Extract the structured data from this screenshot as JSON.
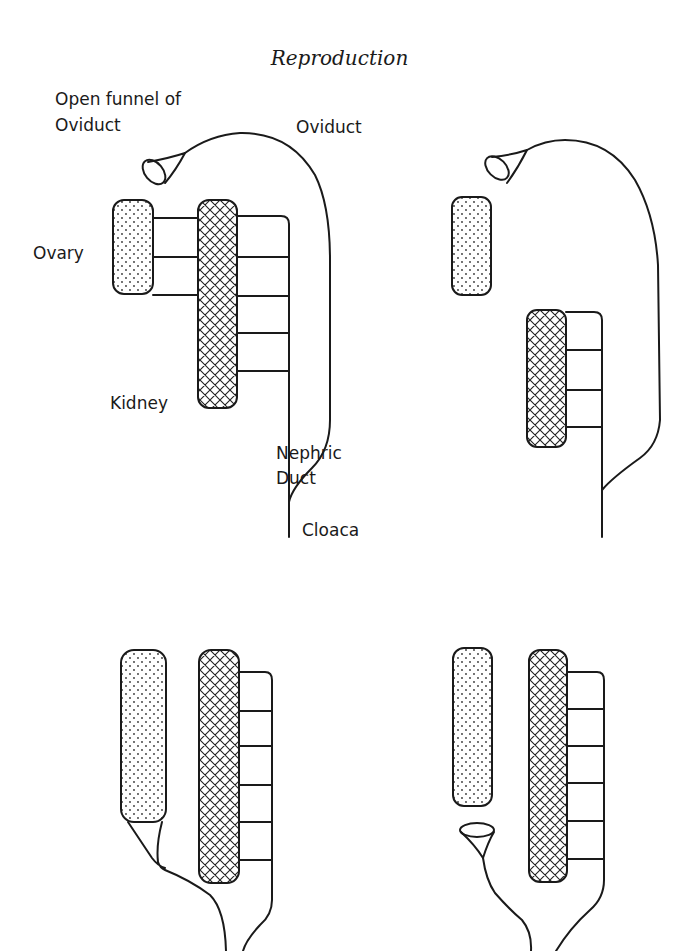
{
  "title": "Reproduction",
  "labels": {
    "open_funnel_line1": "Open funnel of",
    "open_funnel_line2": "Oviduct",
    "oviduct": "Oviduct",
    "ovary": "Ovary",
    "kidney": "Kidney",
    "nephric_line1": "Nephric",
    "nephric_line2": "Duct",
    "cloaca": "Cloaca"
  },
  "panels": [
    {
      "id": "top-left",
      "ovary_tubules": 3,
      "nephric_rungs": 4,
      "funnel": "open, separate from ovary"
    },
    {
      "id": "top-right",
      "ovary_tubules": 0,
      "nephric_rungs": 3,
      "funnel": "open, separate from ovary"
    },
    {
      "id": "bottom-left",
      "ovary_tubules": 0,
      "nephric_rungs": 5,
      "funnel": "fused to ovary"
    },
    {
      "id": "bottom-right",
      "ovary_tubules": 0,
      "nephric_rungs": 5,
      "funnel": "open, below ovary"
    }
  ],
  "colors": {
    "ink": "#1a1a1a",
    "background": "#ffffff"
  }
}
